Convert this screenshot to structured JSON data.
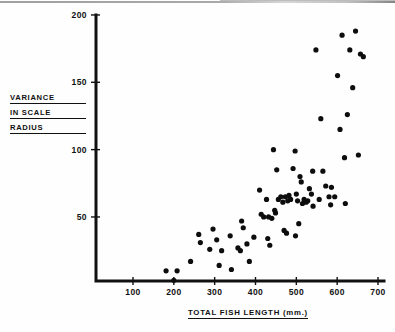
{
  "figure": {
    "background_color": "#ffffff",
    "ink_color": "#111111"
  },
  "axis_labels": {
    "y_line1": "VARIANCE",
    "y_line2": "IN SCALE",
    "y_line3": "RADIUS",
    "x_title": "TOTAL FISH LENGTH  (mm.)"
  },
  "chart_data": {
    "type": "scatter",
    "title": "",
    "xlabel": "TOTAL FISH LENGTH (mm.)",
    "ylabel": "VARIANCE IN SCALE RADIUS",
    "xlim": [
      0,
      720
    ],
    "ylim": [
      0,
      200
    ],
    "xticks": [
      100,
      200,
      300,
      400,
      500,
      600,
      700
    ],
    "xtick_labels": [
      "100",
      "200",
      "300",
      "400",
      "500",
      "600",
      "700"
    ],
    "yticks": [
      50,
      100,
      150,
      200
    ],
    "ytick_labels": [
      "50",
      "100",
      "150",
      "200"
    ],
    "grid": false,
    "legend": false,
    "marker": "filled-circle",
    "marker_color": "#0d0d0d",
    "marker_size_px": 5.2,
    "n_points": 78,
    "points": [
      [
        181,
        10
      ],
      [
        200,
        3
      ],
      [
        208,
        10
      ],
      [
        241,
        17
      ],
      [
        261,
        37
      ],
      [
        265,
        31
      ],
      [
        288,
        26
      ],
      [
        296,
        41
      ],
      [
        305,
        33
      ],
      [
        311,
        14
      ],
      [
        317,
        25
      ],
      [
        341,
        11
      ],
      [
        357,
        27
      ],
      [
        363,
        25
      ],
      [
        366,
        47
      ],
      [
        370,
        42
      ],
      [
        385,
        17
      ],
      [
        396,
        35
      ],
      [
        410,
        70
      ],
      [
        414,
        52
      ],
      [
        420,
        50
      ],
      [
        427,
        63
      ],
      [
        432,
        50
      ],
      [
        435,
        29
      ],
      [
        440,
        49
      ],
      [
        444,
        100
      ],
      [
        447,
        55
      ],
      [
        449,
        53
      ],
      [
        452,
        85
      ],
      [
        456,
        63
      ],
      [
        462,
        65
      ],
      [
        467,
        61
      ],
      [
        470,
        40
      ],
      [
        473,
        65
      ],
      [
        476,
        38
      ],
      [
        479,
        62
      ],
      [
        482,
        66
      ],
      [
        486,
        63
      ],
      [
        492,
        86
      ],
      [
        497,
        99
      ],
      [
        500,
        67
      ],
      [
        503,
        62
      ],
      [
        506,
        45
      ],
      [
        509,
        80
      ],
      [
        512,
        76
      ],
      [
        515,
        60
      ],
      [
        519,
        63
      ],
      [
        524,
        61
      ],
      [
        528,
        62
      ],
      [
        532,
        71
      ],
      [
        537,
        67
      ],
      [
        541,
        58
      ],
      [
        548,
        174
      ],
      [
        556,
        63
      ],
      [
        560,
        123
      ],
      [
        565,
        84
      ],
      [
        572,
        73
      ],
      [
        580,
        65
      ],
      [
        586,
        72
      ],
      [
        594,
        65
      ],
      [
        601,
        155
      ],
      [
        607,
        115
      ],
      [
        612,
        185
      ],
      [
        618,
        94
      ],
      [
        625,
        126
      ],
      [
        631,
        174
      ],
      [
        638,
        146
      ],
      [
        645,
        188
      ],
      [
        652,
        96
      ],
      [
        657,
        171
      ],
      [
        664,
        169
      ],
      [
        338,
        36
      ],
      [
        379,
        30
      ],
      [
        430,
        34
      ],
      [
        498,
        36
      ],
      [
        540,
        84
      ],
      [
        584,
        59
      ],
      [
        620,
        60
      ]
    ]
  }
}
